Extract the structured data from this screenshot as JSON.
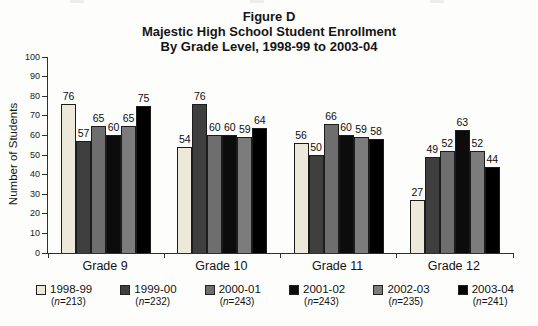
{
  "title": {
    "line1": "Figure D",
    "line2": "Majestic High School Student Enrollment",
    "line3": "By Grade Level, 1998-99 to 2003-04"
  },
  "chart_data": {
    "type": "bar",
    "categories": [
      "Grade 9",
      "Grade 10",
      "Grade 11",
      "Grade 12"
    ],
    "series": [
      {
        "name": "1998-99",
        "count": "213",
        "color": "#ece9da",
        "values": [
          76,
          54,
          56,
          27
        ]
      },
      {
        "name": "1999-00",
        "count": "232",
        "color": "#3f3f3f",
        "values": [
          57,
          76,
          50,
          49
        ]
      },
      {
        "name": "2000-01",
        "count": "243",
        "color": "#6e6e6e",
        "values": [
          65,
          60,
          66,
          52
        ]
      },
      {
        "name": "2001-02",
        "count": "243",
        "color": "#0c0c0c",
        "values": [
          60,
          60,
          60,
          63
        ]
      },
      {
        "name": "2002-03",
        "count": "235",
        "color": "#7c7c7c",
        "values": [
          65,
          59,
          59,
          52
        ]
      },
      {
        "name": "2003-04",
        "count": "241",
        "color": "#000000",
        "values": [
          75,
          64,
          58,
          44
        ]
      }
    ],
    "xlabel": "",
    "ylabel": "Number of Students",
    "ylim": [
      0,
      100
    ],
    "ytick_step": 10,
    "grid": false,
    "legend_position": "bottom",
    "value_labels": true
  }
}
